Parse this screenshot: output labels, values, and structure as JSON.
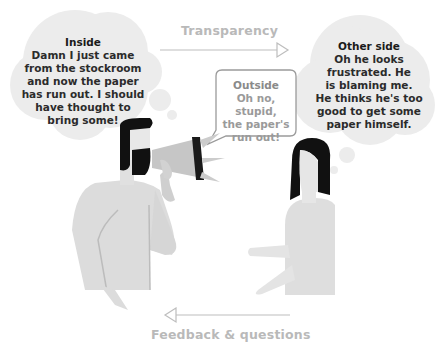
{
  "arrows": {
    "top": {
      "label": "Transparency",
      "direction": "right"
    },
    "bottom": {
      "label": "Feedback & questions",
      "direction": "left"
    }
  },
  "bubbles": {
    "inside": {
      "type": "thought",
      "title": "Inside",
      "lines": [
        "Damn I just came",
        "from the stockroom",
        "and now the paper",
        "has run out. I should",
        "have thought to",
        "bring some!"
      ]
    },
    "outside": {
      "type": "speech",
      "title": "Outside",
      "lines": [
        "Oh no, stupid,",
        "the paper's",
        "run out!"
      ]
    },
    "other_side": {
      "type": "thought",
      "title": "Other side",
      "lines": [
        "Oh he looks",
        "frustrated. He",
        "is blaming me.",
        "He thinks he's too",
        "good to get some",
        "paper himself."
      ]
    }
  },
  "figures": {
    "man": {
      "description": "bearded man shouting through megaphone"
    },
    "woman": {
      "description": "woman with dark bob haircut"
    }
  },
  "colors": {
    "bubble_fill": "#ececec",
    "figure_fill": "#dddddd",
    "hair": "#111111",
    "arrow": "#bdbdbd",
    "label": "#b9b9b9"
  }
}
